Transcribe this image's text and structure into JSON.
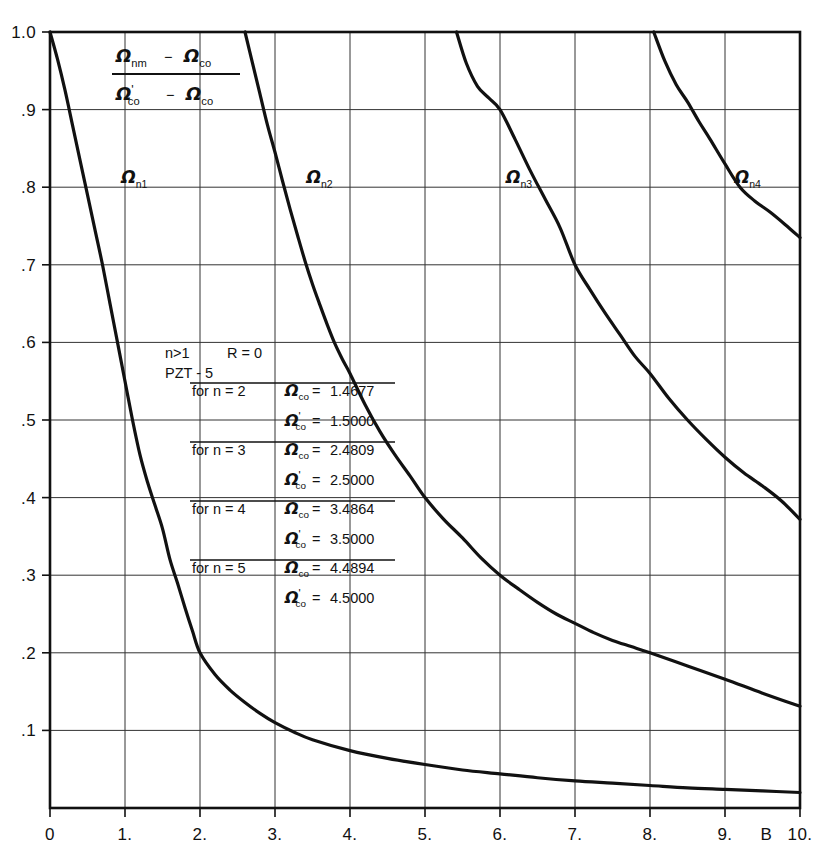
{
  "figure": {
    "background_color": "#ffffff",
    "line_color": "#111111",
    "grid_color": "#333333"
  },
  "yaxis": {
    "title_numerator": "Ω_nm − Ω_co",
    "title_denominator": "Ω'_co − Ω_co",
    "ticks": [
      "1.0",
      ".9",
      ".8",
      ".7",
      ".6",
      ".5",
      ".4",
      ".3",
      ".2",
      ".1"
    ],
    "tick_values": [
      1.0,
      0.9,
      0.8,
      0.7,
      0.6,
      0.5,
      0.4,
      0.3,
      0.2,
      0.1
    ],
    "min": 0,
    "max": 1.0
  },
  "xaxis": {
    "name": "B",
    "ticks": [
      "0",
      "1.",
      "2.",
      "3.",
      "4.",
      "5.",
      "6.",
      "7.",
      "8.",
      "9.",
      "10."
    ],
    "tick_values": [
      0,
      1,
      2,
      3,
      4,
      5,
      6,
      7,
      8,
      9,
      10
    ],
    "min": 0,
    "max": 10
  },
  "title_fraction": {
    "num_main": "Ω",
    "num_sub1": "nm",
    "num_minus": "−",
    "num_main2": "Ω",
    "num_sub2": "co",
    "den_main": "Ω",
    "den_prime": "'",
    "den_sub1": "co",
    "den_minus": "−",
    "den_main2": "Ω",
    "den_sub2": "co"
  },
  "annotation": {
    "condition": "n>1",
    "resistance": "R = 0",
    "material": "PZT - 5",
    "rows": [
      {
        "label": "for n = 2",
        "symbol": "Ω",
        "sub": "co",
        "prime": "",
        "eq": "=",
        "value": "1.4677"
      },
      {
        "label": "",
        "symbol": "Ω",
        "sub": "co",
        "prime": "'",
        "eq": "=",
        "value": "1.5000"
      },
      {
        "label": "for n = 3",
        "symbol": "Ω",
        "sub": "co",
        "prime": "",
        "eq": "=",
        "value": "2.4809"
      },
      {
        "label": "",
        "symbol": "Ω",
        "sub": "co",
        "prime": "'",
        "eq": "=",
        "value": "2.5000"
      },
      {
        "label": "for n = 4",
        "symbol": "Ω",
        "sub": "co",
        "prime": "",
        "eq": "=",
        "value": "3.4864"
      },
      {
        "label": "",
        "symbol": "Ω",
        "sub": "co",
        "prime": "'",
        "eq": "=",
        "value": "3.5000"
      },
      {
        "label": "for n = 5",
        "symbol": "Ω",
        "sub": "co",
        "prime": "",
        "eq": "=",
        "value": "4.4894"
      },
      {
        "label": "",
        "symbol": "Ω",
        "sub": "co",
        "prime": "'",
        "eq": "=",
        "value": "4.5000"
      }
    ]
  },
  "curve_labels": [
    {
      "id": "n1",
      "symbol": "Ω",
      "sub": "n1",
      "x": 0.95,
      "y": 0.805
    },
    {
      "id": "n2",
      "symbol": "Ω",
      "sub": "n2",
      "x": 3.42,
      "y": 0.805
    },
    {
      "id": "n3",
      "symbol": "Ω",
      "sub": "n3",
      "x": 6.08,
      "y": 0.805
    },
    {
      "id": "n4",
      "symbol": "Ω",
      "sub": "n4",
      "x": 9.13,
      "y": 0.805
    }
  ],
  "chart_data": {
    "type": "line",
    "title": "",
    "xlabel": "B",
    "ylabel": "(Ω_nm − Ω_co) / (Ω'_co − Ω_co)",
    "xlim": [
      0,
      10
    ],
    "ylim": [
      0,
      1.0
    ],
    "grid": true,
    "legend": "inline-curve-labels",
    "series": [
      {
        "name": "Ω_n1",
        "points": [
          [
            0.0,
            1.0
          ],
          [
            0.1,
            0.965
          ],
          [
            0.2,
            0.925
          ],
          [
            0.3,
            0.88
          ],
          [
            0.4,
            0.835
          ],
          [
            0.5,
            0.79
          ],
          [
            0.6,
            0.745
          ],
          [
            0.7,
            0.7
          ],
          [
            0.8,
            0.65
          ],
          [
            0.9,
            0.6
          ],
          [
            1.0,
            0.55
          ],
          [
            1.1,
            0.5
          ],
          [
            1.2,
            0.455
          ],
          [
            1.3,
            0.42
          ],
          [
            1.4,
            0.39
          ],
          [
            1.5,
            0.36
          ],
          [
            1.6,
            0.32
          ],
          [
            1.7,
            0.29
          ],
          [
            1.8,
            0.258
          ],
          [
            1.9,
            0.228
          ],
          [
            2.0,
            0.2
          ],
          [
            2.2,
            0.172
          ],
          [
            2.4,
            0.152
          ],
          [
            2.6,
            0.136
          ],
          [
            2.8,
            0.122
          ],
          [
            3.0,
            0.11
          ],
          [
            3.25,
            0.098
          ],
          [
            3.5,
            0.088
          ],
          [
            4.0,
            0.074
          ],
          [
            4.5,
            0.064
          ],
          [
            5.0,
            0.056
          ],
          [
            5.5,
            0.049
          ],
          [
            6.0,
            0.044
          ],
          [
            6.5,
            0.039
          ],
          [
            7.0,
            0.035
          ],
          [
            7.5,
            0.032
          ],
          [
            8.0,
            0.029
          ],
          [
            8.5,
            0.026
          ],
          [
            9.0,
            0.024
          ],
          [
            9.5,
            0.022
          ],
          [
            10.0,
            0.02
          ]
        ]
      },
      {
        "name": "Ω_n2",
        "points": [
          [
            2.6,
            1.0
          ],
          [
            2.7,
            0.96
          ],
          [
            2.8,
            0.92
          ],
          [
            2.9,
            0.88
          ],
          [
            3.0,
            0.845
          ],
          [
            3.1,
            0.808
          ],
          [
            3.2,
            0.772
          ],
          [
            3.3,
            0.738
          ],
          [
            3.4,
            0.705
          ],
          [
            3.5,
            0.675
          ],
          [
            3.6,
            0.648
          ],
          [
            3.7,
            0.622
          ],
          [
            3.8,
            0.598
          ],
          [
            3.9,
            0.578
          ],
          [
            4.0,
            0.56
          ],
          [
            4.2,
            0.52
          ],
          [
            4.4,
            0.485
          ],
          [
            4.6,
            0.455
          ],
          [
            4.8,
            0.428
          ],
          [
            5.0,
            0.4
          ],
          [
            5.25,
            0.372
          ],
          [
            5.5,
            0.348
          ],
          [
            5.75,
            0.322
          ],
          [
            6.0,
            0.3
          ],
          [
            6.25,
            0.282
          ],
          [
            6.5,
            0.265
          ],
          [
            6.75,
            0.25
          ],
          [
            7.0,
            0.238
          ],
          [
            7.25,
            0.226
          ],
          [
            7.5,
            0.216
          ],
          [
            7.75,
            0.208
          ],
          [
            8.0,
            0.2
          ],
          [
            8.5,
            0.183
          ],
          [
            9.0,
            0.166
          ],
          [
            9.5,
            0.148
          ],
          [
            10.0,
            0.131
          ]
        ]
      },
      {
        "name": "Ω_n3",
        "points": [
          [
            5.42,
            1.0
          ],
          [
            5.55,
            0.96
          ],
          [
            5.7,
            0.93
          ],
          [
            5.85,
            0.915
          ],
          [
            6.0,
            0.9
          ],
          [
            6.2,
            0.862
          ],
          [
            6.4,
            0.822
          ],
          [
            6.6,
            0.785
          ],
          [
            6.8,
            0.748
          ],
          [
            7.0,
            0.7
          ],
          [
            7.2,
            0.668
          ],
          [
            7.4,
            0.638
          ],
          [
            7.6,
            0.61
          ],
          [
            7.8,
            0.582
          ],
          [
            8.0,
            0.56
          ],
          [
            8.25,
            0.528
          ],
          [
            8.5,
            0.5
          ],
          [
            8.75,
            0.475
          ],
          [
            9.0,
            0.452
          ],
          [
            9.25,
            0.432
          ],
          [
            9.5,
            0.415
          ],
          [
            9.75,
            0.396
          ],
          [
            10.0,
            0.372
          ]
        ]
      },
      {
        "name": "Ω_n4",
        "points": [
          [
            8.05,
            1.0
          ],
          [
            8.2,
            0.962
          ],
          [
            8.35,
            0.932
          ],
          [
            8.5,
            0.91
          ],
          [
            8.65,
            0.885
          ],
          [
            8.8,
            0.862
          ],
          [
            9.0,
            0.83
          ],
          [
            9.2,
            0.8
          ],
          [
            9.4,
            0.782
          ],
          [
            9.6,
            0.768
          ],
          [
            9.8,
            0.752
          ],
          [
            10.0,
            0.735
          ]
        ]
      }
    ]
  }
}
